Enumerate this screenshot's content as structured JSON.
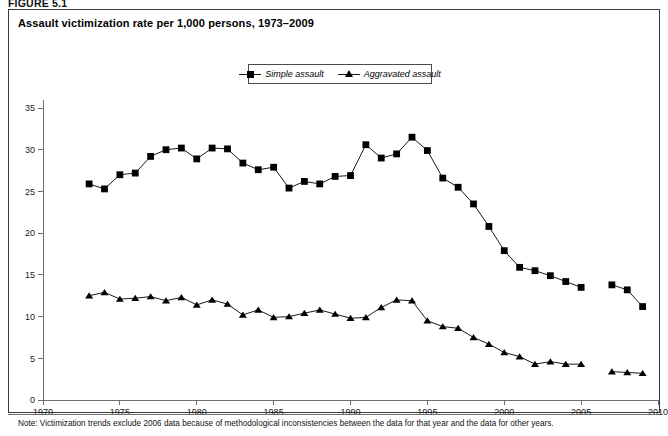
{
  "figure": {
    "label": "FIGURE 5.1",
    "title": "Assault victimization rate per 1,000 persons, 1973–2009",
    "note": "Note: Victimization trends exclude 2006 data because of methodological inconsistencies between the data for that year and the data for other years."
  },
  "legend": {
    "position": "top-center",
    "entries": [
      {
        "label": "Simple assault",
        "marker": "square",
        "color": "#000000"
      },
      {
        "label": "Aggravated assault",
        "marker": "triangle",
        "color": "#000000"
      }
    ]
  },
  "chart_data": {
    "type": "line",
    "title": "Assault victimization rate per 1,000 persons, 1973–2009",
    "xlabel": "",
    "ylabel": "",
    "xlim": [
      1970,
      2010
    ],
    "ylim": [
      0,
      35
    ],
    "xticks": [
      1970,
      1975,
      1980,
      1985,
      1990,
      1995,
      2000,
      2005,
      2010
    ],
    "yticks": [
      0,
      5,
      10,
      15,
      20,
      25,
      30,
      35
    ],
    "xtick_labels": [
      "1970",
      "1975",
      "1980",
      "1985",
      "1990",
      "1995",
      "2000",
      "2005",
      "2010"
    ],
    "ytick_labels": [
      "0",
      "5",
      "10",
      "15",
      "20",
      "25",
      "30",
      "35"
    ],
    "grid": false,
    "legend_position": "top-center",
    "annotations": [
      "2006 data excluded"
    ],
    "x": [
      1973,
      1974,
      1975,
      1976,
      1977,
      1978,
      1979,
      1980,
      1981,
      1982,
      1983,
      1984,
      1985,
      1986,
      1987,
      1988,
      1989,
      1990,
      1991,
      1992,
      1993,
      1994,
      1995,
      1996,
      1997,
      1998,
      1999,
      2000,
      2001,
      2002,
      2003,
      2004,
      2005,
      2007,
      2008,
      2009
    ],
    "series": [
      {
        "name": "Simple assault",
        "marker": "square",
        "color": "#000000",
        "values": [
          25.9,
          25.3,
          27.0,
          27.2,
          29.2,
          30.0,
          30.2,
          28.9,
          30.2,
          30.1,
          28.4,
          27.6,
          27.9,
          25.4,
          26.2,
          25.9,
          26.8,
          26.9,
          30.6,
          29.0,
          29.5,
          31.5,
          29.9,
          26.6,
          25.5,
          23.5,
          20.8,
          17.9,
          15.9,
          15.5,
          14.9,
          14.2,
          13.5,
          13.8,
          13.2,
          11.2
        ]
      },
      {
        "name": "Aggravated assault",
        "marker": "triangle",
        "color": "#000000",
        "values": [
          12.5,
          12.9,
          12.1,
          12.2,
          12.4,
          11.9,
          12.3,
          11.4,
          12.0,
          11.5,
          10.2,
          10.8,
          9.9,
          10.0,
          10.4,
          10.8,
          10.3,
          9.8,
          9.9,
          11.1,
          12.0,
          11.9,
          9.5,
          8.8,
          8.6,
          7.5,
          6.7,
          5.7,
          5.2,
          4.3,
          4.6,
          4.3,
          4.3,
          3.4,
          3.3,
          3.2
        ]
      }
    ]
  }
}
